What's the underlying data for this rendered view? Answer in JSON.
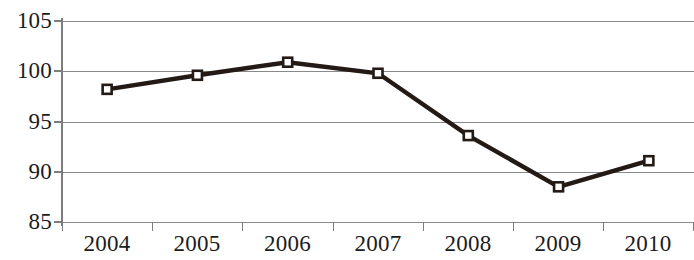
{
  "chart_data": {
    "type": "line",
    "title": "",
    "subtitle": "",
    "xlabel": "",
    "ylabel": "",
    "categories": [
      "2004",
      "2005",
      "2006",
      "2007",
      "2008",
      "2009",
      "2010"
    ],
    "values": [
      98.2,
      99.6,
      100.9,
      99.8,
      93.6,
      88.5,
      91.1
    ],
    "series": [
      {
        "name": "",
        "values": [
          98.2,
          99.6,
          100.9,
          99.8,
          93.6,
          88.5,
          91.1
        ]
      }
    ],
    "ylim": [
      85,
      105
    ],
    "ytick_labels": [
      "105",
      "100",
      "95",
      "90",
      "85"
    ],
    "ytick_values": [
      105,
      100,
      95,
      90,
      85
    ],
    "ytick_step": 5,
    "grid": true,
    "grid_axis": "y",
    "legend": false,
    "legend_position": "none",
    "marker": "open-square",
    "line_color": "#231a16",
    "marker_fill": "#ffffff",
    "marker_edge_color": "#231a16",
    "grid_color": "#8a8a8a",
    "axis_color": "#7d7d7d",
    "text_color": "#1c1c1c",
    "background": "#ffffff",
    "annotations": []
  }
}
